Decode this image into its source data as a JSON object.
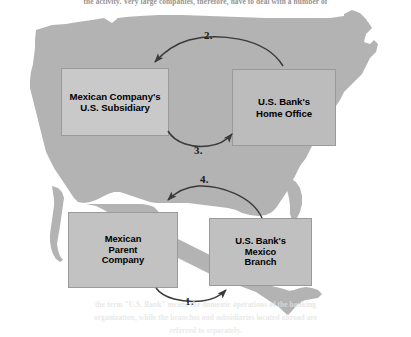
{
  "page": {
    "body_text_top": "the activity. Very large companies, therefore, have to deal with a number of",
    "body_text_bottom_1": "the term \"U.S. Bank\" means the domestic operations of the banking",
    "body_text_bottom_2": "organization, while the branches and subsidiaries located abroad are",
    "body_text_bottom_3": "referred to separately."
  },
  "figure": {
    "name": "correspondent-banking-flow-map",
    "map": {
      "region_label": "United States and Mexico",
      "fill_color": "#b3b3b3"
    },
    "boxes": [
      {
        "id": "subsidiary",
        "label": "Mexican Company's\nU.S. Subsidiary",
        "line1": "Mexican Company's",
        "line2": "U.S. Subsidiary",
        "fill_color": "#c9c9c9"
      },
      {
        "id": "home-office",
        "label": "U.S. Bank's\nHome Office",
        "line1": "U.S. Bank's",
        "line2": "Home Office",
        "fill_color": "#bcbcbc"
      },
      {
        "id": "parent",
        "label": "Mexican\nParent\nCompany",
        "line1": "Mexican",
        "line2": "Parent",
        "line3": "Company",
        "fill_color": "#c2c2c2"
      },
      {
        "id": "mexico-branch",
        "label": "U.S. Bank's\nMexico\nBranch",
        "line1": "U.S. Bank's",
        "line2": "Mexico",
        "line3": "Branch",
        "fill_color": "#c0c0c0"
      }
    ],
    "steps": [
      {
        "number": "1.",
        "from": "parent",
        "to": "mexico-branch",
        "direction": "right"
      },
      {
        "number": "2.",
        "from": "home-office",
        "to": "subsidiary",
        "direction": "left"
      },
      {
        "number": "3.",
        "from": "subsidiary",
        "to": "home-office",
        "direction": "right"
      },
      {
        "number": "4.",
        "from": "mexico-branch",
        "to": "parent",
        "direction": "left"
      }
    ],
    "arrow_color": "#3a3a3a",
    "shadow_color": "#4a4a4a"
  }
}
